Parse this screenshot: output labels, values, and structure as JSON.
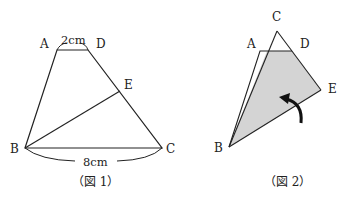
{
  "figure1": {
    "caption": "（図 1）",
    "points": {
      "A": "A",
      "B": "B",
      "C": "C",
      "D": "D",
      "E": "E"
    },
    "measurements": {
      "AD": "2cm",
      "BC": "8cm"
    }
  },
  "figure2": {
    "caption": "（図 2）",
    "points": {
      "A": "A",
      "B": "B",
      "C": "C",
      "D": "D",
      "E": "E"
    },
    "shade_color": "#d4d4d4",
    "arrow": "fold-arrow"
  },
  "colors": {
    "stroke": "#222222",
    "shade": "#d4d4d4"
  }
}
